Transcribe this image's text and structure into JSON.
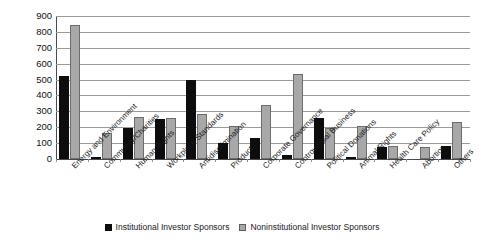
{
  "chart_data": {
    "type": "bar",
    "title": "",
    "subtitle": "",
    "xlabel": "",
    "ylabel": "",
    "ylim": [
      0,
      900
    ],
    "ytick_step": 100,
    "yticks": [
      "900",
      "800",
      "700",
      "600",
      "500",
      "400",
      "300",
      "200",
      "100",
      "0"
    ],
    "grid": "horizontal",
    "legend_position": "bottom-center",
    "categories": [
      "Energy and Environment",
      "Community/Charities",
      "Human Rights",
      "Workplace Standards",
      "Antidiscrimination",
      "Product",
      "Corporate Governance",
      "Controversial Business",
      "Political Donations",
      "Animal Rights",
      "Health Care Policy",
      "Abortion",
      "Others"
    ],
    "series": [
      {
        "name": "Institutional Investor Sponsors",
        "color": "#0d0d0d",
        "values": [
          520,
          12,
          195,
          250,
          495,
          98,
          133,
          26,
          260,
          8,
          76,
          0,
          79
        ]
      },
      {
        "name": "Noninstitutional Investor Sponsors",
        "color": "#a8a8a8",
        "values": [
          845,
          163,
          262,
          257,
          281,
          208,
          338,
          533,
          195,
          206,
          80,
          77,
          230
        ]
      }
    ]
  },
  "legend": {
    "items": [
      {
        "label": "Institutional Investor Sponsors",
        "swatch": "black-square-marker"
      },
      {
        "label": "Noninstitutional Investor Sponsors",
        "swatch": "gray-square-marker"
      }
    ]
  }
}
